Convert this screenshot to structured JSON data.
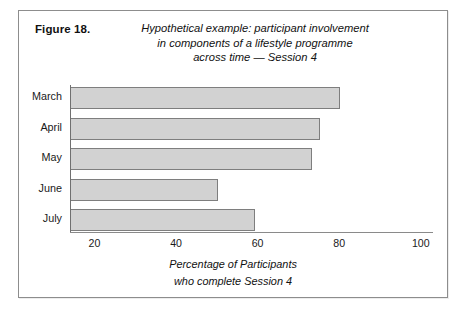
{
  "figure": {
    "label": "Figure 18.",
    "title_lines": [
      "Hypothetical example: participant involvement",
      "in components of a lifestyle programme",
      "across time — Session 4"
    ]
  },
  "chart_data": {
    "type": "bar",
    "orientation": "horizontal",
    "title": "Hypothetical example: participant involvement in components of a lifestyle programme across time — Session 4",
    "categories": [
      "March",
      "April",
      "May",
      "June",
      "July"
    ],
    "values": [
      80,
      75,
      73,
      50,
      59
    ],
    "xlabel_lines": [
      "Percentage of Participants",
      "who complete Session 4"
    ],
    "ylabel": "",
    "xlim": [
      14,
      103
    ],
    "xticks": [
      20,
      40,
      60,
      80,
      100
    ],
    "xtick_labels": [
      "20",
      "40",
      "60",
      "80",
      "100"
    ],
    "grid": false,
    "legend": false,
    "bar_fill": "#d2d2d2",
    "bar_border": "#7e7e7e",
    "axis_color": "#8a8a8a"
  }
}
